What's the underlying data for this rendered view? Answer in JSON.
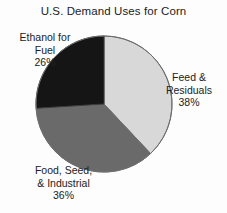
{
  "chart_data": {
    "type": "pie",
    "title": "U.S. Demand Uses for Corn",
    "xlabel": "",
    "ylabel": "",
    "legend_position": "none",
    "grid": false,
    "categories": [
      "Feed & Residuals",
      "Food, Seed, & Industrial",
      "Ethanol for Fuel"
    ],
    "values": [
      38,
      36,
      26
    ],
    "value_unit": "%",
    "start_angle_deg": 0,
    "direction": "clockwise",
    "slices": [
      {
        "name": "Feed & Residuals",
        "label_line1": "Feed &",
        "label_line2": "Residuals",
        "value": 38,
        "value_label": "38%",
        "color": "#d8d8d8",
        "start_deg": 0,
        "end_deg": 136.8
      },
      {
        "name": "Food, Seed, & Industrial",
        "label_line1": "Food, Seed,",
        "label_line2": "& Industrial",
        "value": 36,
        "value_label": "36%",
        "color": "#6a6a6a",
        "start_deg": 136.8,
        "end_deg": 266.4
      },
      {
        "name": "Ethanol for Fuel",
        "label_line1": "Ethanol for",
        "label_line2": "Fuel",
        "value": 26,
        "value_label": "26%",
        "color": "#151515",
        "start_deg": 266.4,
        "end_deg": 360
      }
    ]
  },
  "colors": {
    "background": "#fdfdfd",
    "text": "#222222",
    "outline": "#6e6e6e",
    "slice_feed": "#d8d8d8",
    "slice_food": "#6a6a6a",
    "slice_ethanol": "#151515"
  }
}
